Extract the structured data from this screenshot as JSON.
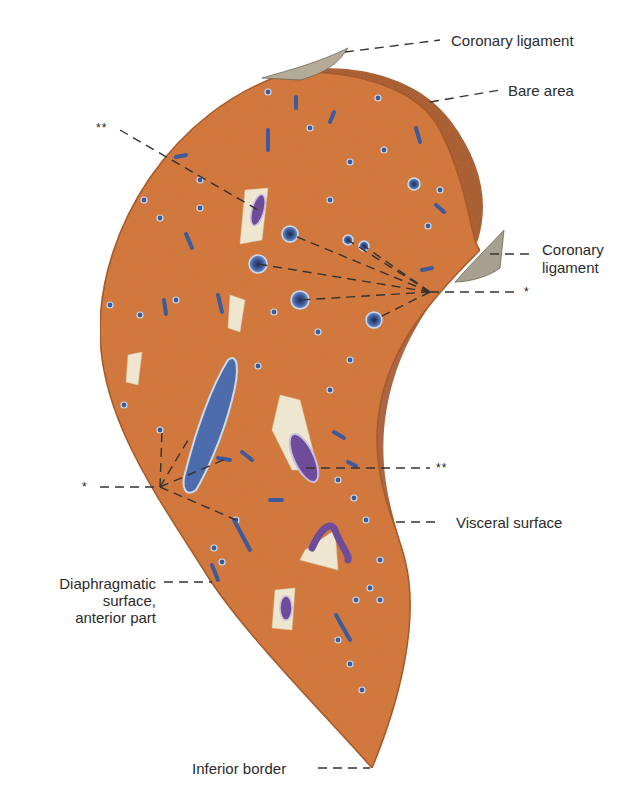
{
  "figure": {
    "colors": {
      "parenchyma": "#d4743a",
      "parenchyma_dark": "#b85a28",
      "bare_area": "#a4552e",
      "vessel_fill": "#3f5a9a",
      "vessel_rim": "#c9dcef",
      "portal_vein": "#6e4c9a",
      "ligament": "#a8a08e",
      "leader_line": "#333333"
    }
  },
  "labels": {
    "coronary_ligament_top": "Coronary ligament",
    "bare_area": "Bare area",
    "coronary_ligament_right_line1": "Coronary",
    "coronary_ligament_right_line2": "ligament",
    "star_right": "*",
    "double_star_top": "**",
    "double_star_right": "**",
    "star_left": "*",
    "visceral_surface": "Visceral surface",
    "diaphragmatic_line1": "Diaphragmatic",
    "diaphragmatic_line2": "surface,",
    "diaphragmatic_line3": "anterior part",
    "inferior_border": "Inferior border"
  }
}
